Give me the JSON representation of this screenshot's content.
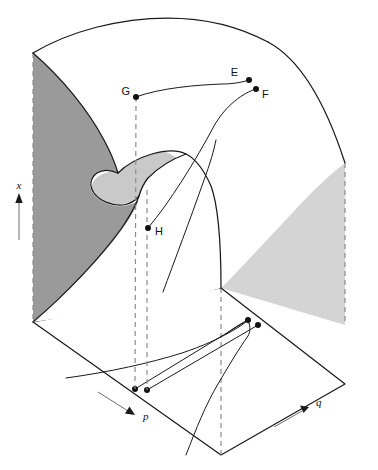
{
  "figure": {
    "type": "geometric-diagram",
    "background_color": "#ffffff"
  },
  "colors": {
    "line": "#1a1a1a",
    "dashed_line": "#8c8c8c",
    "dark_face": "#9a9a9a",
    "light_face": "#d4d4d4",
    "mid_face": "#c9c9c9",
    "surface_top": "#ffffff",
    "marker": "#111111"
  },
  "axes": {
    "vertical": {
      "label": "x",
      "direction": "up",
      "name": "x-axis"
    },
    "control_left": {
      "label": "p",
      "direction": "down-right",
      "name": "p-axis"
    },
    "control_right": {
      "label": "q",
      "direction": "up-right",
      "name": "q-axis"
    }
  },
  "points": [
    {
      "id": "E",
      "label": "E",
      "cx": 249,
      "cy": 80,
      "label_x": 240,
      "label_y": 76,
      "surface": "upper-sheet"
    },
    {
      "id": "F",
      "label": "F",
      "cx": 256,
      "cy": 89,
      "label_x": 262,
      "label_y": 97,
      "surface": "upper-sheet"
    },
    {
      "id": "G",
      "label": "G",
      "cx": 136,
      "cy": 97,
      "label_x": 127,
      "label_y": 94,
      "surface": "upper-sheet"
    },
    {
      "id": "H",
      "label": "H",
      "cx": 148,
      "cy": 228,
      "label_x": 155,
      "label_y": 235,
      "surface": "lower-sheet"
    }
  ],
  "base_plane_points": [
    {
      "id": "Gp",
      "cx": 135,
      "cy": 389,
      "note": "projection of G"
    },
    {
      "id": "Hp",
      "cx": 147,
      "cy": 390,
      "note": "projection of H"
    },
    {
      "id": "Ep",
      "cx": 248,
      "cy": 320,
      "note": "projection of E"
    },
    {
      "id": "Fp",
      "cx": 258,
      "cy": 325,
      "note": "projection of F"
    }
  ],
  "legend_notes": {
    "dark_shaded_face": "left back wall",
    "light_shaded_face": "right back wall",
    "fold_curve": "cusp fold edges of the equilibrium surface",
    "bifurcation_set": "cusp-shaped curve in the control plane"
  }
}
